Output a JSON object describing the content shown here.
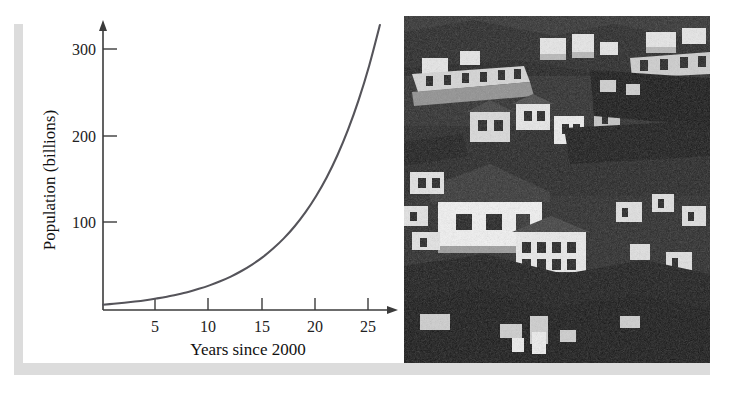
{
  "figure": {
    "background_color": "#ffffff",
    "frame_color": "#dcdcdc"
  },
  "chart_data": {
    "type": "line",
    "title": "",
    "xlabel": "Years since 2000",
    "ylabel": "Population (billions)",
    "xlim": [
      0,
      27.5
    ],
    "ylim": [
      0,
      340
    ],
    "xticks": [
      5,
      10,
      15,
      20,
      25
    ],
    "xtick_labels": [
      "5",
      "10",
      "15",
      "20",
      "25"
    ],
    "yticks": [
      100,
      200,
      300
    ],
    "ytick_labels": [
      "100",
      "200",
      "300"
    ],
    "grid": false,
    "legend": "none",
    "axis_arrows": true,
    "curve_color": "#55545a",
    "axis_color": "#3b3b3b",
    "series": [
      {
        "name": "Population",
        "model": "exponential",
        "x": [
          0,
          1,
          2,
          3,
          4,
          5,
          6,
          7,
          8,
          9,
          10,
          11,
          12,
          13,
          14,
          15,
          16,
          17,
          18,
          19,
          20,
          21,
          22,
          23,
          24,
          25,
          26
        ],
        "values": [
          6.1,
          7.1,
          8.3,
          9.7,
          11.3,
          13.2,
          15.3,
          17.9,
          20.8,
          24.3,
          28.3,
          33.0,
          38.4,
          44.8,
          52.2,
          60.8,
          70.9,
          82.6,
          96.3,
          112.2,
          130.8,
          152.4,
          177.6,
          207.0,
          241.2,
          281.1,
          327.6
        ]
      }
    ]
  },
  "photo": {
    "alt": "Black and white aerial photograph of a densely packed hillside settlement with many small houses and rooftops",
    "style": "high-contrast black and white",
    "dominant_colors": [
      "#111111",
      "#f2f2f2",
      "#6e6e6e"
    ]
  },
  "axis_labels": {
    "x_title": "Years since 2000",
    "y_title": "Population (billions)"
  }
}
